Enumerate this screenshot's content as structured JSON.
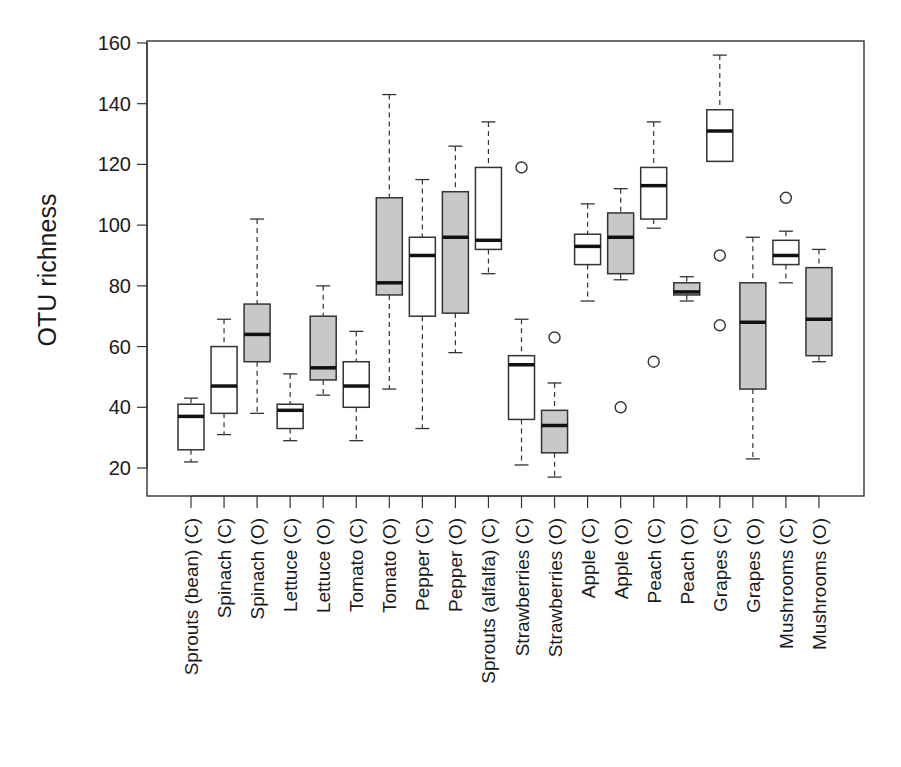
{
  "chart_data": {
    "type": "boxplot",
    "title": "",
    "xlabel": "",
    "ylabel": "OTU richness",
    "ylim": [
      10,
      160
    ],
    "yticks": [
      20,
      40,
      60,
      80,
      100,
      120,
      140,
      160
    ],
    "grid": false,
    "legend": null,
    "fill_colors": {
      "C": "#ffffff",
      "O": "#c8c8c8"
    },
    "categories": [
      "Sprouts (bean) (C)",
      "Spinach (C)",
      "Spinach (O)",
      "Lettuce (C)",
      "Lettuce (O)",
      "Tomato (C)",
      "Tomato (O)",
      "Pepper (C)",
      "Pepper (O)",
      "Sprouts (alfalfa) (C)",
      "Strawberries (C)",
      "Strawberries (O)",
      "Apple (C)",
      "Apple (O)",
      "Peach (C)",
      "Peach (O)",
      "Grapes (C)",
      "Grapes (O)",
      "Mushrooms (C)",
      "Mushrooms (O)"
    ],
    "boxes": [
      {
        "label": "Sprouts (bean) (C)",
        "group": "C",
        "whisker_low": 22,
        "q1": 26,
        "median": 37,
        "q3": 41,
        "whisker_high": 43,
        "outliers": []
      },
      {
        "label": "Spinach (C)",
        "group": "C",
        "whisker_low": 31,
        "q1": 38,
        "median": 47,
        "q3": 60,
        "whisker_high": 69,
        "outliers": []
      },
      {
        "label": "Spinach (O)",
        "group": "O",
        "whisker_low": 38,
        "q1": 55,
        "median": 64,
        "q3": 74,
        "whisker_high": 102,
        "outliers": []
      },
      {
        "label": "Lettuce (C)",
        "group": "C",
        "whisker_low": 29,
        "q1": 33,
        "median": 39,
        "q3": 41,
        "whisker_high": 51,
        "outliers": []
      },
      {
        "label": "Lettuce (O)",
        "group": "O",
        "whisker_low": 44,
        "q1": 49,
        "median": 53,
        "q3": 70,
        "whisker_high": 80,
        "outliers": []
      },
      {
        "label": "Tomato (C)",
        "group": "C",
        "whisker_low": 29,
        "q1": 40,
        "median": 47,
        "q3": 55,
        "whisker_high": 65,
        "outliers": []
      },
      {
        "label": "Tomato (O)",
        "group": "O",
        "whisker_low": 46,
        "q1": 77,
        "median": 81,
        "q3": 109,
        "whisker_high": 143,
        "outliers": []
      },
      {
        "label": "Pepper (C)",
        "group": "C",
        "whisker_low": 33,
        "q1": 70,
        "median": 90,
        "q3": 96,
        "whisker_high": 115,
        "outliers": []
      },
      {
        "label": "Pepper (O)",
        "group": "O",
        "whisker_low": 58,
        "q1": 71,
        "median": 96,
        "q3": 111,
        "whisker_high": 126,
        "outliers": []
      },
      {
        "label": "Sprouts (alfalfa) (C)",
        "group": "C",
        "whisker_low": 84,
        "q1": 92,
        "median": 95,
        "q3": 119,
        "whisker_high": 134,
        "outliers": []
      },
      {
        "label": "Strawberries (C)",
        "group": "C",
        "whisker_low": 21,
        "q1": 36,
        "median": 54,
        "q3": 57,
        "whisker_high": 69,
        "outliers": [
          119
        ]
      },
      {
        "label": "Strawberries (O)",
        "group": "O",
        "whisker_low": 17,
        "q1": 25,
        "median": 34,
        "q3": 39,
        "whisker_high": 48,
        "outliers": [
          63
        ]
      },
      {
        "label": "Apple (C)",
        "group": "C",
        "whisker_low": 75,
        "q1": 87,
        "median": 93,
        "q3": 97,
        "whisker_high": 107,
        "outliers": []
      },
      {
        "label": "Apple (O)",
        "group": "O",
        "whisker_low": 82,
        "q1": 84,
        "median": 96,
        "q3": 104,
        "whisker_high": 112,
        "outliers": [
          40
        ]
      },
      {
        "label": "Peach (C)",
        "group": "C",
        "whisker_low": 99,
        "q1": 102,
        "median": 113,
        "q3": 119,
        "whisker_high": 134,
        "outliers": [
          55
        ]
      },
      {
        "label": "Peach (O)",
        "group": "O",
        "whisker_low": 75,
        "q1": 77,
        "median": 78,
        "q3": 81,
        "whisker_high": 83,
        "outliers": []
      },
      {
        "label": "Grapes (C)",
        "group": "C",
        "whisker_low": 121,
        "q1": 121,
        "median": 131,
        "q3": 138,
        "whisker_high": 156,
        "outliers": [
          90,
          67
        ]
      },
      {
        "label": "Grapes (O)",
        "group": "O",
        "whisker_low": 23,
        "q1": 46,
        "median": 68,
        "q3": 81,
        "whisker_high": 96,
        "outliers": []
      },
      {
        "label": "Mushrooms (C)",
        "group": "C",
        "whisker_low": 81,
        "q1": 87,
        "median": 90,
        "q3": 95,
        "whisker_high": 98,
        "outliers": [
          109
        ]
      },
      {
        "label": "Mushrooms (O)",
        "group": "O",
        "whisker_low": 55,
        "q1": 57,
        "median": 69,
        "q3": 86,
        "whisker_high": 92,
        "outliers": []
      }
    ]
  },
  "axes": {
    "ylabel": "OTU richness"
  }
}
